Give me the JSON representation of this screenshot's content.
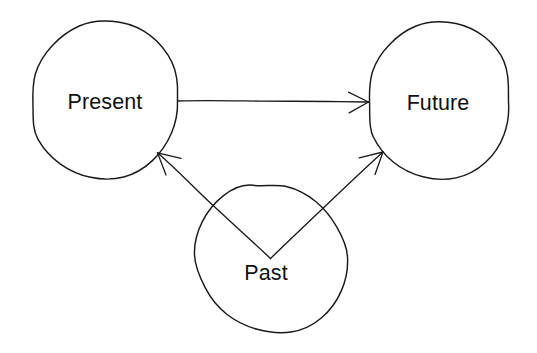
{
  "diagram": {
    "type": "node-link-diagram",
    "background_color": "#ffffff",
    "stroke_color": "#1a1a1a",
    "text_color": "#111111",
    "nodes": [
      {
        "id": "present",
        "label": "Present",
        "shape": "circle",
        "cx": 105,
        "cy": 102,
        "r": 73
      },
      {
        "id": "future",
        "label": "Future",
        "shape": "circle",
        "cx": 439,
        "cy": 104,
        "r": 70
      },
      {
        "id": "past",
        "label": "Past",
        "shape": "circle",
        "cx": 271,
        "cy": 258,
        "r": 76
      }
    ],
    "edges": [
      {
        "id": "present-to-future",
        "from": "Present",
        "to": "Future",
        "label": "",
        "arrow": "single",
        "direction": "right"
      },
      {
        "id": "past-to-present",
        "from": "Past",
        "to": "Present",
        "label": "",
        "arrow": "single",
        "direction": "up-left"
      },
      {
        "id": "past-to-future",
        "from": "Past",
        "to": "Future",
        "label": "",
        "arrow": "single",
        "direction": "up-right"
      }
    ]
  }
}
